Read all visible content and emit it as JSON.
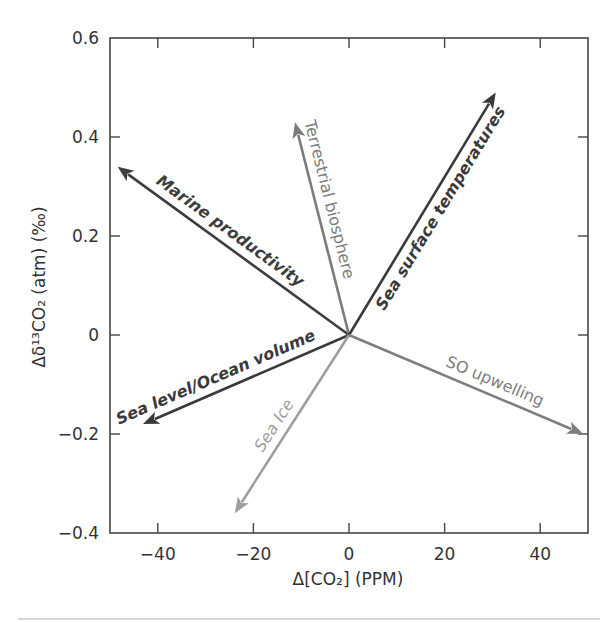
{
  "chart_data": {
    "type": "vector",
    "title": "",
    "xlabel": "Δ[CO₂] (PPM)",
    "ylabel": "Δδ¹³CO₂ (atm) (‰)",
    "xlim": [
      -50,
      50
    ],
    "ylim": [
      -0.4,
      0.6
    ],
    "xticks": [
      -40,
      -20,
      0,
      20,
      40
    ],
    "xtick_labels": [
      "−40",
      "−20",
      "0",
      "20",
      "40"
    ],
    "yticks": [
      -0.4,
      -0.2,
      0,
      0.2,
      0.4,
      0.6
    ],
    "ytick_labels": [
      "−0.4",
      "−0.2",
      "0",
      "0.2",
      "0.4",
      "0.6"
    ],
    "grid": false,
    "ticks_direction": "in",
    "origin": [
      0,
      0
    ],
    "series": [
      {
        "name": "Marine productivity",
        "x": -48.4,
        "y": 0.34,
        "color": "#3d3d3d",
        "style": "bold-italic",
        "label_side": "above"
      },
      {
        "name": "Terrestrial biosphere",
        "x": -11.3,
        "y": 0.43,
        "color": "#7c7c7c",
        "style": "normal",
        "label_side": "right"
      },
      {
        "name": "Sea surface temperatures",
        "x": 30.7,
        "y": 0.49,
        "color": "#3a3a3a",
        "style": "bold-italic",
        "label_side": "right"
      },
      {
        "name": "Sea level/Ocean volume",
        "x": -43.1,
        "y": -0.18,
        "color": "#3a3a3a",
        "style": "bold-italic",
        "label_side": "above"
      },
      {
        "name": "Sea Ice",
        "x": -23.9,
        "y": -0.36,
        "color": "#9e9e9e",
        "style": "italic",
        "label_side": "left"
      },
      {
        "name": "SO upwelling",
        "x": 49.0,
        "y": -0.2,
        "color": "#7e7e7e",
        "style": "normal",
        "label_side": "above"
      }
    ]
  },
  "labels": {
    "xlabel": "Δ[CO₂] (PPM)",
    "ylabel": "Δδ¹³CO₂ (atm) (‰)"
  }
}
